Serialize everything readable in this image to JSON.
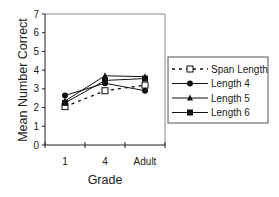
{
  "chart_data": {
    "type": "line",
    "title": "",
    "xlabel": "Grade",
    "ylabel": "Mean Number Correct",
    "categories": [
      "1",
      "4",
      "Adult"
    ],
    "ylim": [
      0,
      7
    ],
    "yticks": [
      0,
      1,
      2,
      3,
      4,
      5,
      6,
      7
    ],
    "grid": false,
    "legend_position": "right",
    "series": [
      {
        "name": "Span Length",
        "marker": "open-square",
        "line": "dashed",
        "values": [
          2.05,
          2.9,
          3.2
        ]
      },
      {
        "name": "Length 4",
        "marker": "filled-circle",
        "line": "solid",
        "values": [
          2.65,
          3.3,
          2.9
        ]
      },
      {
        "name": "Length 5",
        "marker": "filled-triangle",
        "line": "solid",
        "values": [
          2.35,
          3.7,
          3.65
        ]
      },
      {
        "name": "Length 6",
        "marker": "filled-square",
        "line": "solid",
        "values": [
          2.25,
          3.45,
          3.55
        ]
      }
    ],
    "colors": {
      "line": "#111111",
      "frame": "#888888",
      "axis": "#222222"
    }
  }
}
